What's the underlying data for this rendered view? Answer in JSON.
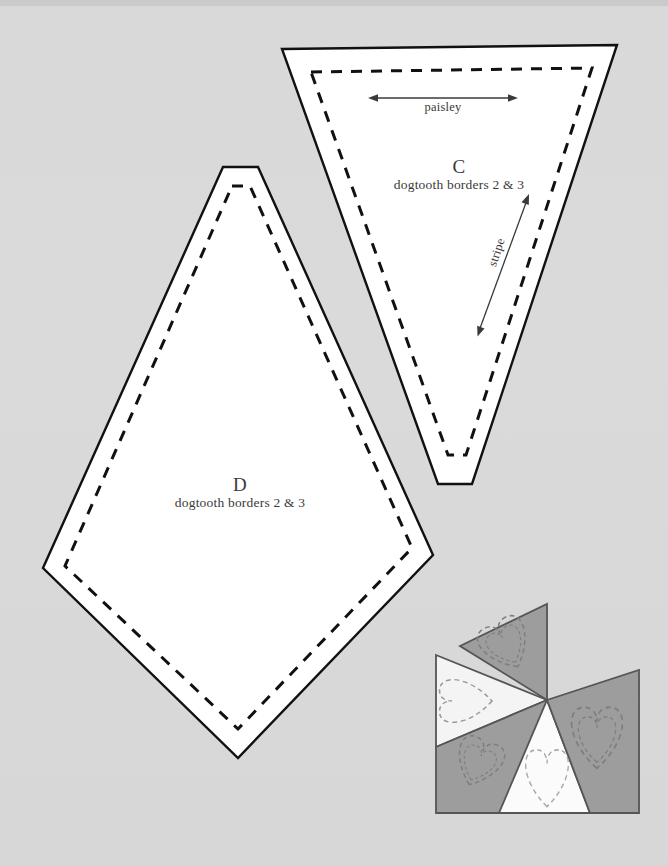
{
  "page": {
    "background_color": "#d9d9d9",
    "ink_color": "#111111",
    "label_color": "#3a3a3a"
  },
  "templates": [
    {
      "id": "C",
      "letter": "C",
      "subtitle": "dogtooth borders 2 & 3",
      "shape": "truncated-triangle",
      "outline_points": "282,49 617,45 472,484 438,484",
      "seam_points": "311,72 592,68 466,455 448,455",
      "direction_arrows": [
        {
          "name": "paisley",
          "label": "paisley",
          "orientation": "horizontal",
          "x1": 370,
          "y1": 98,
          "x2": 516,
          "y2": 98
        },
        {
          "name": "stripe",
          "label": "stripe",
          "orientation": "diagonal",
          "x1": 477,
          "y1": 335,
          "x2": 530,
          "y2": 196
        }
      ]
    },
    {
      "id": "D",
      "letter": "D",
      "subtitle": "dogtooth borders 2 & 3",
      "shape": "truncated-kite",
      "outline_points": "223,167 258,167 433,555 238,758 43,568",
      "seam_points": "232,186 250,186 412,548 238,729 65,566"
    }
  ],
  "block_diagram": {
    "name": "pinwheel-heart-block",
    "fills": {
      "dark_gray": "#9a9a9a",
      "mid_gray": "#a8a8a8",
      "light": "#f2f2f2",
      "white": "#fbfbfb",
      "outline": "#555555",
      "quilting_dash": "#8a8a8a"
    },
    "wedges": [
      {
        "name": "wedge-top-dark",
        "tone": "dark",
        "points": "460,646 547,604 547,700"
      },
      {
        "name": "wedge-left-light",
        "tone": "light",
        "points": "436,655 547,700 436,747"
      },
      {
        "name": "wedge-bottom-left-dark",
        "tone": "dark",
        "points": "436,747 547,700 547,813 436,813"
      },
      {
        "name": "wedge-bottom-white",
        "tone": "white",
        "points": "547,700 589,813 500,813"
      },
      {
        "name": "wedge-right-dark",
        "tone": "dark",
        "points": "547,700 639,670 639,813 589,813"
      }
    ],
    "hearts": [
      {
        "name": "heart-motif-top",
        "cx": 508,
        "cy": 648,
        "rot": -30,
        "scale": 1.0
      },
      {
        "name": "heart-motif-left",
        "cx": 470,
        "cy": 702,
        "rot": 0,
        "scale": 0.9
      },
      {
        "name": "heart-motif-bottom-left",
        "cx": 474,
        "cy": 768,
        "rot": 25,
        "scale": 1.0
      },
      {
        "name": "heart-motif-bottom",
        "cx": 546,
        "cy": 780,
        "rot": 0,
        "scale": 0.85
      },
      {
        "name": "heart-motif-right",
        "cx": 595,
        "cy": 745,
        "rot": 0,
        "scale": 1.05
      }
    ]
  }
}
